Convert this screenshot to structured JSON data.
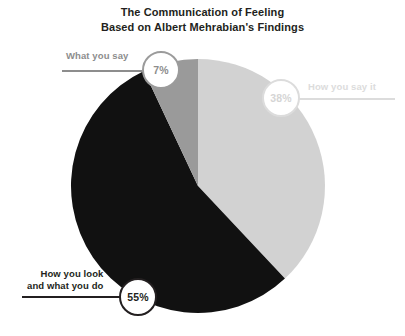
{
  "chart_data": {
    "type": "pie",
    "title": "The Communication of Feeling Based on Albert Mehrabian's Findings",
    "title_lines": [
      "The Communication of Feeling",
      "Based on Albert Mehrabian's Findings"
    ],
    "categories": [
      "How you say it",
      "How you look and what you do",
      "What you say"
    ],
    "values": [
      38,
      55,
      7
    ],
    "value_labels": [
      "38%",
      "55%",
      "7%"
    ],
    "colors": [
      "#d2d2d2",
      "#111111",
      "#9a9a9a"
    ],
    "start_angle_deg": 0,
    "direction": "clockwise",
    "legend": "none",
    "labels_position": "callout",
    "xlabel": "",
    "ylabel": "",
    "slices": [
      {
        "name": "How you say it",
        "value": 38,
        "value_label": "38%",
        "color": "#d2d2d2",
        "label_color": "#dcdcdc",
        "label_lines": [
          "How you say it"
        ]
      },
      {
        "name": "How you look and what you do",
        "value": 55,
        "value_label": "55%",
        "color": "#111111",
        "label_color": "#231f20",
        "label_lines": [
          "How you look",
          "and what you do"
        ]
      },
      {
        "name": "What you say",
        "value": 7,
        "value_label": "7%",
        "color": "#9a9a9a",
        "label_color": "#8d8d8d",
        "label_lines": [
          "What you say"
        ]
      }
    ]
  }
}
